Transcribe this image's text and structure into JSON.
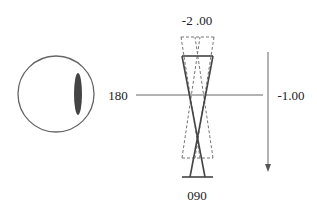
{
  "diagram": {
    "labels": {
      "top_power": "-2 .00",
      "right_power": "-1.00",
      "left_axis": "180",
      "bottom_axis": "090"
    },
    "colors": {
      "line": "#555555",
      "text": "#222222",
      "ellipse_fill": "#444444",
      "background": "#ffffff"
    },
    "elements": {
      "eye_circle": "circle-outline",
      "focal_line": "vertical-dark-ellipse",
      "axis_line": "horizontal-meridian-line",
      "solid_cone": "solid-hourglass-cone",
      "dashed_cone": "dashed-hourglass-cone",
      "power_arrow": "downward-arrow"
    }
  }
}
